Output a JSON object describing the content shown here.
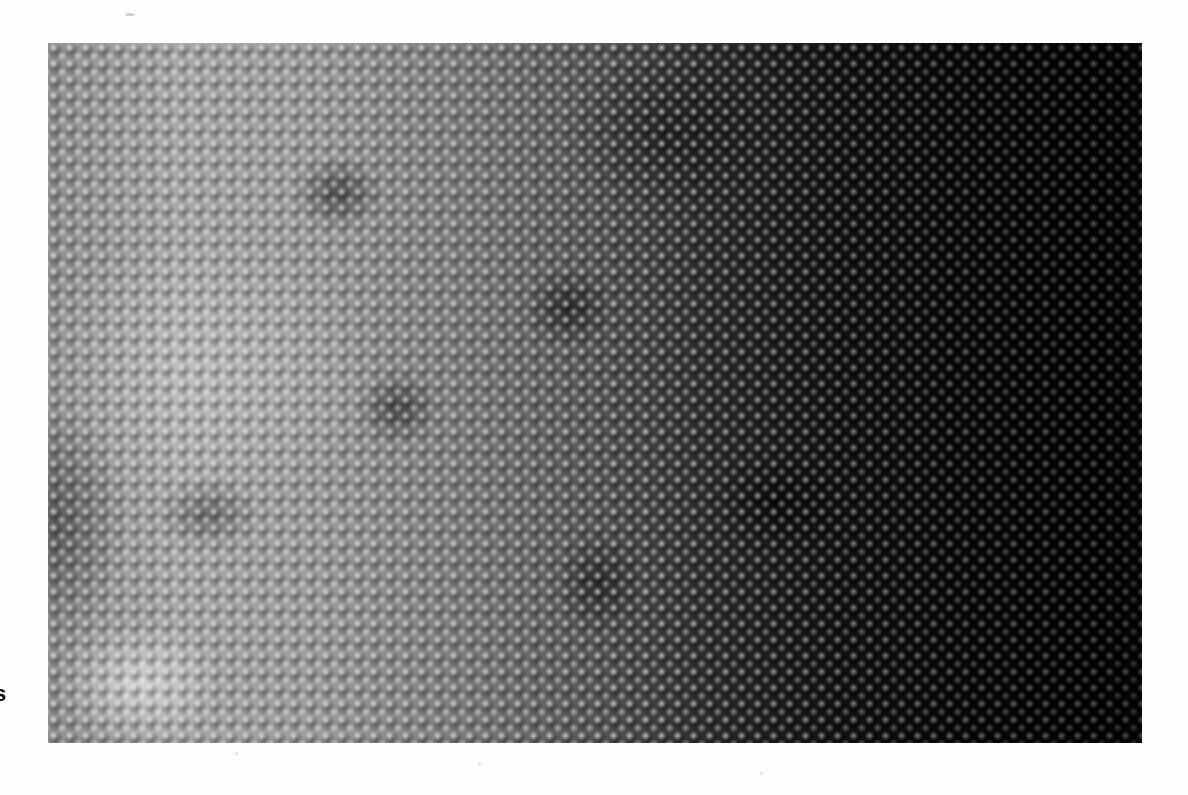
{
  "page": {
    "type": "scanned-book-page",
    "background_color": "#fefefe"
  },
  "caption": {
    "clipped_text": "s",
    "note_visible": "partial bold glyph at left page edge"
  },
  "photo": {
    "subject": "grayscale macro photograph of bumpy scaled texture",
    "tone": "bright gray on left fading to near-black on right",
    "colors": {
      "light": "#a9a9a9",
      "mid": "#555555",
      "dark": "#050505"
    }
  }
}
